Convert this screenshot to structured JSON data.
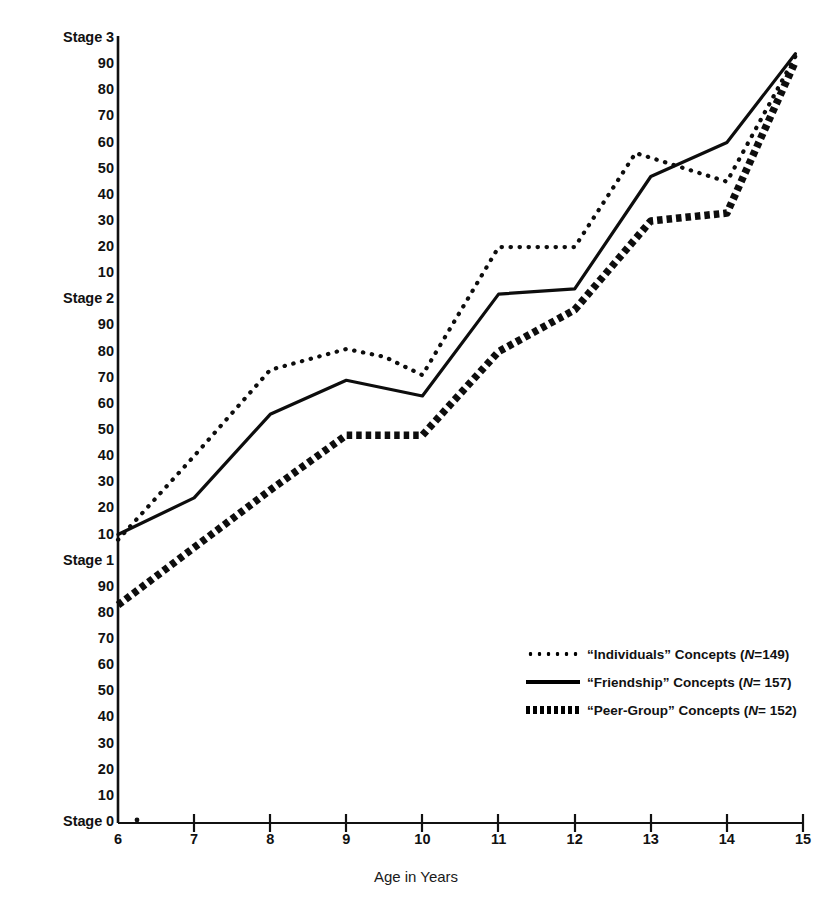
{
  "chart_data": {
    "type": "line",
    "title": "",
    "xlabel": "Age in Years",
    "ylabel": "Mean IMS Score",
    "xlim": [
      6,
      15
    ],
    "ylim": [
      0,
      300
    ],
    "grid": false,
    "legend_position": "lower-right",
    "x_ticks": [
      "6",
      "7",
      "8",
      "9",
      "10",
      "11",
      "12",
      "13",
      "14",
      "15"
    ],
    "x_tick_values": [
      6,
      7,
      8,
      9,
      10,
      11,
      12,
      13,
      14,
      15
    ],
    "y_ticks": [
      "Stage 3",
      "90",
      "80",
      "70",
      "60",
      "50",
      "40",
      "30",
      "20",
      "10",
      "Stage 2",
      "90",
      "80",
      "70",
      "60",
      "50",
      "40",
      "30",
      "20",
      "10",
      "Stage 1",
      "90",
      "80",
      "70",
      "60",
      "50",
      "40",
      "30",
      "20",
      "10",
      "Stage 0"
    ],
    "y_tick_values": [
      300,
      290,
      280,
      270,
      260,
      250,
      240,
      230,
      220,
      210,
      200,
      190,
      180,
      170,
      160,
      150,
      140,
      130,
      120,
      110,
      100,
      90,
      80,
      70,
      60,
      50,
      40,
      30,
      20,
      10,
      0
    ],
    "series": [
      {
        "name": "“Individuals” Concepts",
        "n_label": "N",
        "n_value": "149",
        "style": "dotted",
        "x": [
          6,
          7,
          8,
          9,
          9.5,
          10,
          11,
          12,
          12.8,
          14,
          14.9
        ],
        "values": [
          108,
          140,
          173,
          181,
          178,
          171,
          220,
          220,
          256,
          245,
          293
        ]
      },
      {
        "name": "“Friendship” Concepts",
        "n_label": "N",
        "n_value": "157",
        "style": "solid",
        "x": [
          6,
          7,
          8,
          9,
          10,
          11,
          12,
          13,
          14,
          14.9
        ],
        "values": [
          110,
          124,
          156,
          169,
          163,
          202,
          204,
          247,
          260,
          294
        ]
      },
      {
        "name": "“Peer-Group” Concepts",
        "n_label": "N",
        "n_value": "152",
        "style": "thick-dashed",
        "x": [
          6,
          7,
          8,
          9,
          10,
          11,
          12,
          13,
          14,
          14.9
        ],
        "values": [
          83,
          105,
          127,
          148,
          148,
          180,
          196,
          230,
          233,
          291
        ]
      }
    ]
  },
  "legend": {
    "items": [
      {
        "swatch": "dotted",
        "prefix": "“Individuals” Concepts (",
        "italic_n": "N",
        "suffix": "=149)"
      },
      {
        "swatch": "solid",
        "prefix": "“Friendship” Concepts (",
        "italic_n": "N",
        "suffix": "= 157)"
      },
      {
        "swatch": "thick-dashed",
        "prefix": "“Peer-Group” Concepts (",
        "italic_n": "N",
        "suffix": "= 152)"
      }
    ]
  },
  "colors": {
    "ink": "#111111",
    "background": "#ffffff"
  }
}
